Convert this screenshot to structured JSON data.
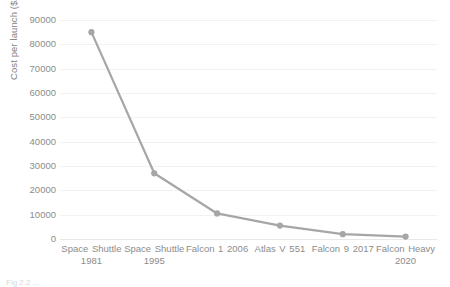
{
  "chart_data": {
    "type": "line",
    "title": "",
    "xlabel": "",
    "ylabel": "Cost per launch ($/kg)",
    "categories": [
      "Space Shuttle 1981",
      "Space Shuttle 1995",
      "Falcon 1 2006",
      "Atlas V 551",
      "Falcon 9 2017",
      "Falcon Heavy 2020"
    ],
    "category_lines": [
      [
        "Space Shuttle",
        "1981"
      ],
      [
        "Space Shuttle",
        "1995"
      ],
      [
        "Falcon 1 2006",
        ""
      ],
      [
        "Atlas V 551",
        ""
      ],
      [
        "Falcon 9 2017",
        ""
      ],
      [
        "Falcon Heavy",
        "2020"
      ]
    ],
    "values": [
      85000,
      27000,
      10500,
      5500,
      2000,
      1000
    ],
    "ylim": [
      0,
      90000
    ],
    "ytick_values": [
      0,
      10000,
      20000,
      30000,
      40000,
      50000,
      60000,
      70000,
      80000,
      90000
    ],
    "ytick_labels": [
      "0",
      "10000",
      "20000",
      "30000",
      "40000",
      "50000",
      "60000",
      "70000",
      "80000",
      "90000"
    ],
    "grid": true,
    "legend": false,
    "legend_position": "none",
    "series_color": "#a6a6a6",
    "marker_color": "#a6a6a6",
    "gridline_color": "#f2f2f2",
    "text_color": "#8c8c8c"
  },
  "caption": {
    "text": "Fig 2.2 ..."
  }
}
